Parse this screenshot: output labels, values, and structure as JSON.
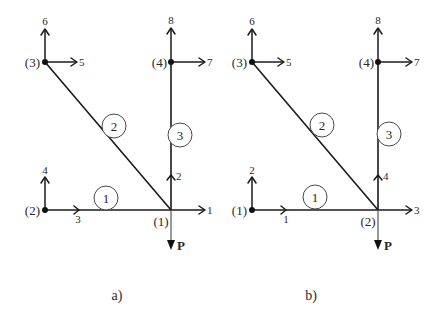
{
  "figure": {
    "panel_a": {
      "caption": "a)",
      "nodes": [
        {
          "label": "(1)",
          "x": 171,
          "y": 210
        },
        {
          "label": "(2)",
          "x": 45,
          "y": 210
        },
        {
          "label": "(3)",
          "x": 45,
          "y": 62
        },
        {
          "label": "(4)",
          "x": 171,
          "y": 62
        }
      ],
      "elements": [
        {
          "label": "1",
          "from": "(2)",
          "to": "(1)"
        },
        {
          "label": "2",
          "from": "(3)",
          "to": "(1)"
        },
        {
          "label": "3",
          "from": "(1)",
          "to": "(4)"
        }
      ],
      "dofs": {
        "d1": "1",
        "d2": "2",
        "d3": "3",
        "d4": "4",
        "d5": "5",
        "d6": "6",
        "d7": "7",
        "d8": "8"
      },
      "load": "P"
    },
    "panel_b": {
      "caption": "b)",
      "nodes": [
        {
          "label": "(1)",
          "x": 252,
          "y": 210
        },
        {
          "label": "(2)",
          "x": 378,
          "y": 210
        },
        {
          "label": "(3)",
          "x": 252,
          "y": 62
        },
        {
          "label": "(4)",
          "x": 378,
          "y": 62
        }
      ],
      "elements": [
        {
          "label": "1",
          "from": "(1)",
          "to": "(2)"
        },
        {
          "label": "2",
          "from": "(3)",
          "to": "(2)"
        },
        {
          "label": "3",
          "from": "(2)",
          "to": "(4)"
        }
      ],
      "dofs": {
        "d1": "1",
        "d2": "2",
        "d3": "3",
        "d4": "4",
        "d5": "5",
        "d6": "6",
        "d7": "7",
        "d8": "8"
      },
      "load": "P"
    }
  }
}
